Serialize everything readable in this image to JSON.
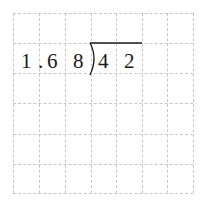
{
  "problem": {
    "divisor": [
      "1",
      ".",
      "6",
      "8"
    ],
    "dividend": [
      "4",
      "2"
    ]
  },
  "grid": {
    "columns": 7,
    "rows": 6,
    "line_color": "#c8c8c8"
  }
}
